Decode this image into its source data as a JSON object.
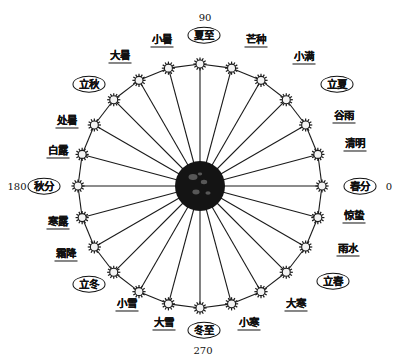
{
  "figure": {
    "center_body": "sun",
    "geometry": {
      "center_x": 200,
      "center_y": 186,
      "ring_radius": 122,
      "node_count": 24,
      "node_glyph": "sun-node-icon"
    }
  },
  "angle_markers": [
    {
      "name": "spring-equinox-angle",
      "value": "0",
      "x": 389,
      "y": 186,
      "align": "right"
    },
    {
      "name": "summer-solstice-angle",
      "value": "90",
      "x": 205,
      "y": 17,
      "align": "center"
    },
    {
      "name": "autumn-equinox-angle",
      "value": "180",
      "x": 17,
      "y": 186,
      "align": "left"
    },
    {
      "name": "winter-solstice-angle",
      "value": "270",
      "x": 203,
      "y": 350,
      "align": "center"
    }
  ],
  "terms": [
    {
      "id": "chunfen",
      "label": "春分",
      "angle": 0,
      "style": "ellipse",
      "lx": 360,
      "ly": 186
    },
    {
      "id": "qingming",
      "label": "清明",
      "angle": 15,
      "style": "underlined",
      "lx": 355,
      "ly": 145
    },
    {
      "id": "guyu",
      "label": "谷雨",
      "angle": 30,
      "style": "underlined",
      "lx": 344,
      "ly": 117
    },
    {
      "id": "lixia",
      "label": "立夏",
      "angle": 45,
      "style": "ellipse",
      "lx": 337,
      "ly": 84
    },
    {
      "id": "xiaoman",
      "label": "小满",
      "angle": 60,
      "style": "underlined",
      "lx": 304,
      "ly": 58
    },
    {
      "id": "mangzhong",
      "label": "芒种",
      "angle": 75,
      "style": "underlined",
      "lx": 256,
      "ly": 41
    },
    {
      "id": "xiazhi",
      "label": "夏至",
      "angle": 90,
      "style": "ellipse",
      "lx": 204,
      "ly": 35
    },
    {
      "id": "xiaoshu",
      "label": "小暑",
      "angle": 105,
      "style": "underlined",
      "lx": 162,
      "ly": 41
    },
    {
      "id": "dashu",
      "label": "大暑",
      "angle": 120,
      "style": "underlined",
      "lx": 120,
      "ly": 57
    },
    {
      "id": "liqiu",
      "label": "立秋",
      "angle": 135,
      "style": "ellipse",
      "lx": 89,
      "ly": 84
    },
    {
      "id": "chushu",
      "label": "处暑",
      "angle": 150,
      "style": "underlined",
      "lx": 67,
      "ly": 122
    },
    {
      "id": "bailu",
      "label": "白露",
      "angle": 165,
      "style": "underlined",
      "lx": 58,
      "ly": 152
    },
    {
      "id": "qiufen",
      "label": "秋分",
      "angle": 180,
      "style": "ellipse",
      "lx": 44,
      "ly": 186
    },
    {
      "id": "hanlu",
      "label": "寒露",
      "angle": 195,
      "style": "underlined",
      "lx": 58,
      "ly": 223
    },
    {
      "id": "shuangjiang",
      "label": "霜降",
      "angle": 210,
      "style": "underlined",
      "lx": 66,
      "ly": 255
    },
    {
      "id": "lidong",
      "label": "立冬",
      "angle": 225,
      "style": "ellipse",
      "lx": 89,
      "ly": 284
    },
    {
      "id": "xiaoxue",
      "label": "小雪",
      "angle": 240,
      "style": "underlined",
      "lx": 127,
      "ly": 305
    },
    {
      "id": "daxue",
      "label": "大雪",
      "angle": 255,
      "style": "underlined",
      "lx": 164,
      "ly": 324
    },
    {
      "id": "dongzhi",
      "label": "冬至",
      "angle": 270,
      "style": "ellipse",
      "lx": 204,
      "ly": 330
    },
    {
      "id": "xiaohan",
      "label": "小寒",
      "angle": 285,
      "style": "underlined",
      "lx": 249,
      "ly": 324
    },
    {
      "id": "dahan",
      "label": "大寒",
      "angle": 300,
      "style": "underlined",
      "lx": 296,
      "ly": 305
    },
    {
      "id": "lichun",
      "label": "立春",
      "angle": 315,
      "style": "ellipse",
      "lx": 333,
      "ly": 281
    },
    {
      "id": "yushui",
      "label": "雨水",
      "angle": 330,
      "style": "underlined",
      "lx": 348,
      "ly": 250
    },
    {
      "id": "jingzhe",
      "label": "惊蛰",
      "angle": 345,
      "style": "underlined",
      "lx": 354,
      "ly": 217
    }
  ],
  "colors": {
    "stroke": "#1a1a1a",
    "background": "#ffffff",
    "sun_fill": "#141414",
    "node_fill": "#f4f4f4"
  }
}
